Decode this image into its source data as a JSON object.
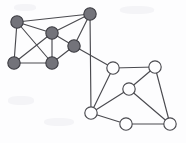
{
  "figure": {
    "background_color": "#fdfdfe",
    "width": 186,
    "height": 143
  },
  "style": {
    "edge_color": "#4a4a4f",
    "edge_width": 1.15,
    "filled_node_fill": "#73737a",
    "filled_node_stroke": "#3c3c42",
    "open_node_fill": "#fefeff",
    "open_node_stroke": "#4a4a4f",
    "node_radius": 6.2
  },
  "chart_data": {
    "type": "diagram",
    "subtype": "node-link-graph",
    "title": "",
    "xlabel": "",
    "ylabel": "",
    "nodes": [
      {
        "id": "d1",
        "group": "filled",
        "label": "",
        "x": 17,
        "y": 22
      },
      {
        "id": "d2",
        "group": "filled",
        "label": "",
        "x": 90,
        "y": 14
      },
      {
        "id": "d3",
        "group": "filled",
        "label": "",
        "x": 52,
        "y": 33
      },
      {
        "id": "d4",
        "group": "filled",
        "label": "",
        "x": 74,
        "y": 46
      },
      {
        "id": "d5",
        "group": "filled",
        "label": "",
        "x": 14,
        "y": 63
      },
      {
        "id": "d6",
        "group": "filled",
        "label": "",
        "x": 52,
        "y": 63
      },
      {
        "id": "w1",
        "group": "open",
        "label": "",
        "x": 113,
        "y": 68
      },
      {
        "id": "w2",
        "group": "open",
        "label": "",
        "x": 155,
        "y": 67
      },
      {
        "id": "w3",
        "group": "open",
        "label": "",
        "x": 129,
        "y": 89
      },
      {
        "id": "w4",
        "group": "open",
        "label": "",
        "x": 91,
        "y": 113
      },
      {
        "id": "w5",
        "group": "open",
        "label": "",
        "x": 126,
        "y": 124
      },
      {
        "id": "w6",
        "group": "open",
        "label": "",
        "x": 170,
        "y": 124
      }
    ],
    "edges": [
      {
        "source": "d1",
        "target": "d2"
      },
      {
        "source": "d1",
        "target": "d3"
      },
      {
        "source": "d1",
        "target": "d5"
      },
      {
        "source": "d1",
        "target": "d6"
      },
      {
        "source": "d2",
        "target": "d3"
      },
      {
        "source": "d2",
        "target": "d4"
      },
      {
        "source": "d2",
        "target": "w4"
      },
      {
        "source": "d3",
        "target": "d5"
      },
      {
        "source": "d3",
        "target": "d6"
      },
      {
        "source": "d3",
        "target": "d4"
      },
      {
        "source": "d4",
        "target": "d6"
      },
      {
        "source": "d4",
        "target": "w1"
      },
      {
        "source": "d5",
        "target": "d6"
      },
      {
        "source": "w1",
        "target": "w2"
      },
      {
        "source": "w1",
        "target": "w4"
      },
      {
        "source": "w2",
        "target": "w3"
      },
      {
        "source": "w2",
        "target": "w6"
      },
      {
        "source": "w3",
        "target": "w4"
      },
      {
        "source": "w3",
        "target": "w6"
      },
      {
        "source": "w4",
        "target": "w5"
      },
      {
        "source": "w5",
        "target": "w6"
      }
    ],
    "legend": [
      {
        "key": "filled",
        "label": "",
        "color": "#73737a"
      },
      {
        "key": "open",
        "label": "",
        "color": "#fefeff"
      }
    ],
    "counts": {
      "filled_nodes": 6,
      "open_nodes": 6,
      "total_nodes": 12,
      "total_edges": 21
    },
    "grid": false,
    "annotations": []
  }
}
